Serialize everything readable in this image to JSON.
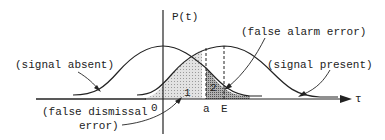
{
  "diagram": {
    "y_axis_label": "P(t)",
    "x_axis_label": "τ",
    "origin_label": "0",
    "threshold_label": "a",
    "mean_label": "E",
    "region_1_label": "1",
    "region_2_label": "2",
    "annotations": {
      "signal_absent": "(signal absent)",
      "signal_present": "(signal present)",
      "false_alarm": "(false alarm error)",
      "false_dismissal_line1": "(false dismissal",
      "false_dismissal_line2": "error)"
    },
    "colors": {
      "line": "#222222",
      "region_1_fill": "#d8d8d8",
      "region_2_fill": "#9a9a9a"
    }
  }
}
